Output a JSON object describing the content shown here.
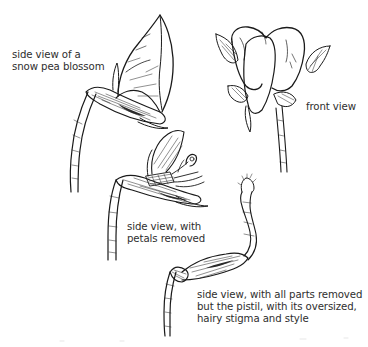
{
  "figure": {
    "subject": "snow pea blossom",
    "style": "black ink line drawing on white",
    "colors": {
      "ink": "#1a1a1a",
      "text": "#2e2e2e",
      "background": "#ffffff"
    }
  },
  "illustrations": [
    {
      "id": "side-view",
      "label_lines": [
        "side view of a",
        "snow pea blossom"
      ]
    },
    {
      "id": "front-view",
      "label_lines": [
        "front view"
      ]
    },
    {
      "id": "petals-removed",
      "label_lines": [
        "side view, with",
        "petals removed"
      ]
    },
    {
      "id": "pistil-only",
      "label_lines": [
        "side view, with all parts removed",
        "but the pistil, with its oversized,",
        "hairy stigma and style"
      ]
    }
  ]
}
